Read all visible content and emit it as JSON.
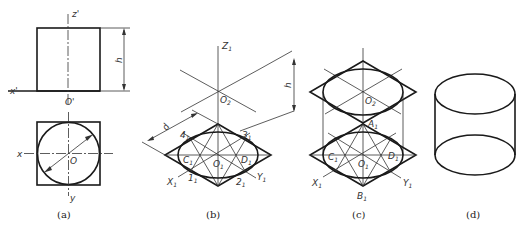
{
  "figure": {
    "panels": [
      {
        "id": "a",
        "caption": "(a)",
        "description": "Orthographic views of a cylinder: front view (rectangle) and top view (circle inscribed in square)",
        "labels": {
          "z_axis": "z'",
          "x_axis_front": "x'",
          "origin_front": "O'",
          "height_dim": "h",
          "x_axis_top": "x",
          "origin_top": "O",
          "y_axis": "y"
        }
      },
      {
        "id": "b",
        "caption": "(b)",
        "description": "Isometric axes construction with rhombus and four-center ellipse for bottom face",
        "labels": {
          "z_axis": "Z",
          "z_axis_sub": "1",
          "top_center": "O",
          "top_center_sub": "2",
          "height_dim": "h",
          "diameter_dim": "d",
          "point4": "4",
          "point4_sub": "1",
          "point3": "3",
          "point3_sub": "1",
          "pointC": "C",
          "pointC_sub": "1",
          "center": "O",
          "center_sub": "1",
          "pointD": "D",
          "pointD_sub": "1",
          "x_axis": "X",
          "x_axis_sub": "1",
          "point1": "1",
          "point1_sub": "1",
          "point2": "2",
          "point2_sub": "1",
          "y_axis": "Y",
          "y_axis_sub": "1"
        }
      },
      {
        "id": "c",
        "caption": "(c)",
        "description": "Both top and bottom ellipses drawn with tangent side lines",
        "labels": {
          "top_center": "O",
          "top_center_sub": "2",
          "pointA": "A",
          "pointA_sub": "1",
          "pointC": "C",
          "pointC_sub": "1",
          "center": "O",
          "center_sub": "1",
          "pointD": "D",
          "pointD_sub": "1",
          "x_axis": "X",
          "x_axis_sub": "1",
          "y_axis": "Y",
          "y_axis_sub": "1",
          "pointB": "B",
          "pointB_sub": "1"
        }
      },
      {
        "id": "d",
        "caption": "(d)",
        "description": "Finished isometric drawing of cylinder"
      }
    ]
  }
}
